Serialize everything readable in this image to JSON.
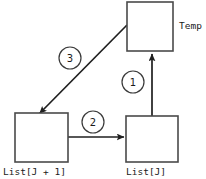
{
  "diagram": {
    "type": "flow-diagram",
    "background_color": "#ffffff",
    "stroke_color": "#1f1f1f",
    "box_stroke_color": "#4a4a4a",
    "boxes": [
      {
        "id": "temp",
        "label": "Temp",
        "label_position": "right",
        "x": 127,
        "y": 2,
        "width": 46,
        "height": 49
      },
      {
        "id": "list_j_plus_1",
        "label": "List[J + 1]",
        "label_position": "below",
        "x": 15,
        "y": 113,
        "width": 53,
        "height": 49
      },
      {
        "id": "list_j",
        "label": "List[J]",
        "label_position": "below",
        "x": 126,
        "y": 116,
        "width": 52,
        "height": 46
      }
    ],
    "arrows": [
      {
        "step": "1",
        "from": "list_j",
        "to": "temp",
        "direction": "up",
        "badge_x": 133,
        "badge_y": 82
      },
      {
        "step": "2",
        "from": "list_j_plus_1",
        "to": "list_j",
        "direction": "right",
        "badge_x": 93,
        "badge_y": 122
      },
      {
        "step": "3",
        "from": "temp",
        "to": "list_j_plus_1",
        "direction": "diagonal-down-left",
        "badge_x": 70,
        "badge_y": 58
      }
    ],
    "badge_radius": 11
  }
}
